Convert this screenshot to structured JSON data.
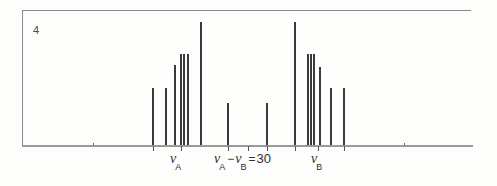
{
  "figure": {
    "plate_number": "4",
    "caption_labels": {
      "nu_a": {
        "symbol": "ν",
        "subscript": "A"
      },
      "nu_b": {
        "symbol": "ν",
        "subscript": "B"
      },
      "separation": {
        "left_symbol": "ν",
        "left_subscript": "A",
        "operator": "−",
        "right_symbol": "ν",
        "right_subscript": "B",
        "equals": "=",
        "value": "30"
      }
    }
  },
  "colors": {
    "peak": "#3a3a3a",
    "baseline": "#9a9a9a",
    "frame": "#8a8a8a",
    "text": "#303030",
    "background": "#fdfdfc"
  },
  "chart_data": {
    "type": "bar",
    "title": "4",
    "xlabel": "",
    "ylabel": "",
    "grid": false,
    "legend": null,
    "axis_note": "Calculated AB-type NMR stick spectrum; intensities in arbitrary units, frequency increasing to the right.",
    "annotations": [
      {
        "text": "ν_A",
        "x": 181,
        "kind": "axis-marker"
      },
      {
        "text": "ν_A − ν_B = 30",
        "x": 248,
        "kind": "separation-label"
      },
      {
        "text": "ν_B",
        "x": 318,
        "kind": "axis-marker"
      }
    ],
    "xlim": [
      22,
      473
    ],
    "ylim": [
      0,
      120
    ],
    "units": "Hz",
    "categories": [
      "L1",
      "L2",
      "L3",
      "L4",
      "L5",
      "L6",
      "L7",
      "M1",
      "M2",
      "R1",
      "R2",
      "R3",
      "R4",
      "R5",
      "R6",
      "R7"
    ],
    "x": [
      153,
      166,
      175,
      181,
      184,
      188,
      201,
      228,
      267,
      295,
      308,
      311,
      314,
      320,
      331,
      344
    ],
    "values": [
      52,
      52,
      72,
      82,
      82,
      82,
      110,
      38,
      38,
      110,
      82,
      82,
      82,
      70,
      52,
      52
    ],
    "bar_width": [
      1.6,
      1.6,
      1.6,
      2.4,
      2.4,
      1.6,
      1.6,
      1.6,
      1.6,
      1.6,
      1.6,
      2.4,
      2.4,
      1.6,
      1.6,
      1.6
    ],
    "baseline_blips": [
      {
        "x": 93,
        "height": 3
      },
      {
        "x": 404,
        "height": 3
      }
    ],
    "axis_ticks": [
      153,
      181,
      228,
      248,
      267,
      295,
      318,
      344
    ]
  }
}
